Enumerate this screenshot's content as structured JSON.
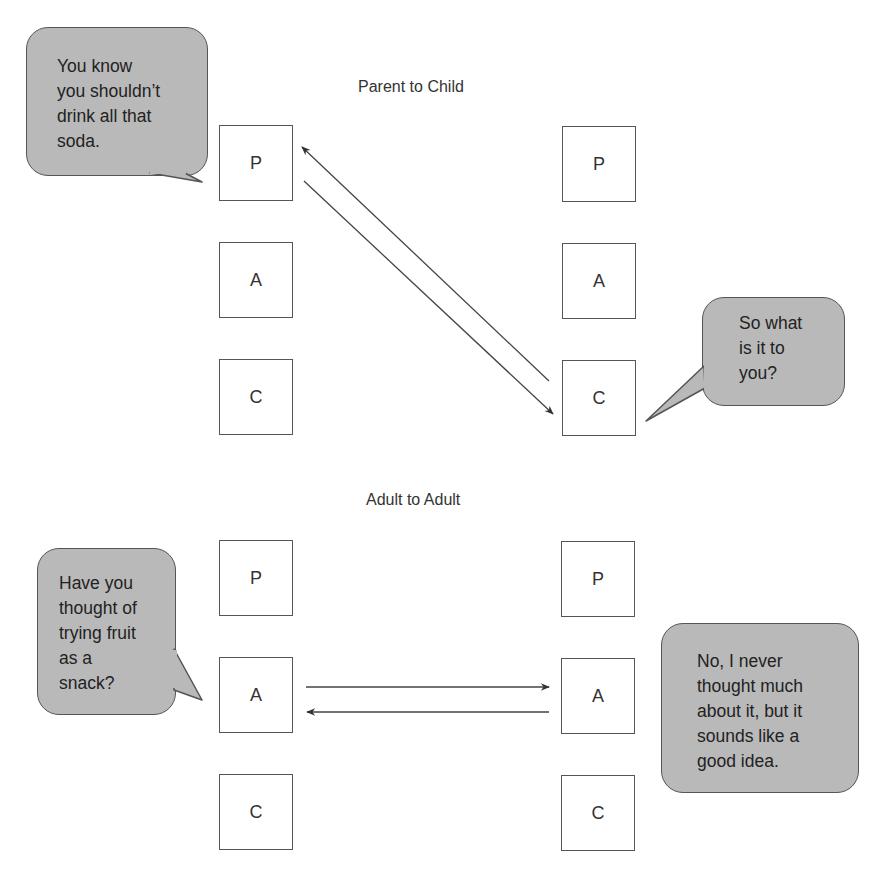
{
  "panels": [
    {
      "title": "Parent to Child",
      "left_column": [
        "P",
        "A",
        "C"
      ],
      "right_column": [
        "P",
        "A",
        "C"
      ],
      "transaction": [
        {
          "from": "left.P",
          "to": "right.C",
          "direction": "down-right"
        },
        {
          "from": "right.C",
          "to": "left.P",
          "direction": "up-left"
        }
      ],
      "left_speech": "You know\nyou shouldn’t\ndrink all that\nsoda.",
      "right_speech": "So what\nis it to\nyou?"
    },
    {
      "title": "Adult to Adult",
      "left_column": [
        "P",
        "A",
        "C"
      ],
      "right_column": [
        "P",
        "A",
        "C"
      ],
      "transaction": [
        {
          "from": "left.A",
          "to": "right.A",
          "direction": "right"
        },
        {
          "from": "right.A",
          "to": "left.A",
          "direction": "left"
        }
      ],
      "left_speech": "Have you\nthought of\ntrying fruit\nas a\nsnack?",
      "right_speech": "No, I never\nthought much\nabout it, but it\nsounds like a\ngood idea."
    }
  ],
  "colors": {
    "bubble_fill": "#b9b9b9",
    "stroke": "#555555",
    "background": "#ffffff"
  }
}
